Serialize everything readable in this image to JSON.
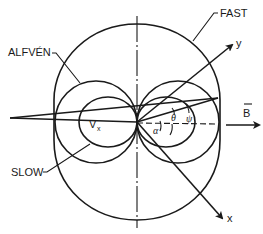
{
  "diagram": {
    "labels": {
      "fast": "FAST",
      "alfven": "ALFVÉN",
      "slow": "SLOW",
      "vx": "V",
      "vx_sub": "x",
      "b_field": "B",
      "y_axis": "y",
      "x_axis": "x",
      "theta": "θ",
      "psi": "ψ",
      "alpha": "α"
    },
    "colors": {
      "line": "#1a1a1a",
      "background": "#ffffff"
    },
    "curves": [
      {
        "name": "fast",
        "shape": "rounded oval enclosing all"
      },
      {
        "name": "alfven",
        "shape": "two circles tangent at origin along B"
      },
      {
        "name": "slow",
        "shape": "two small lobes tangent at origin along B"
      }
    ],
    "vectors": [
      {
        "name": "B",
        "direction": "right"
      },
      {
        "name": "y",
        "direction": "up-right"
      },
      {
        "name": "x",
        "direction": "down-right"
      }
    ]
  }
}
